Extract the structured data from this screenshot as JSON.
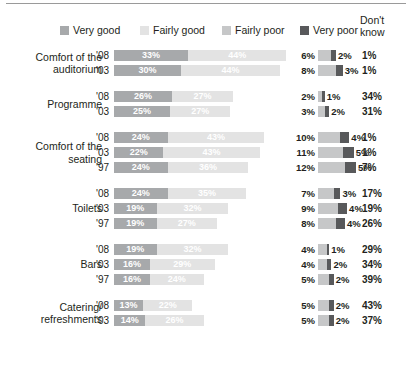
{
  "legend": {
    "items": [
      {
        "label": "Very good",
        "color": "#a7a9ab",
        "icon": "square-swatch-icon"
      },
      {
        "label": "Fairly good",
        "color": "#e3e3e3",
        "icon": "square-swatch-icon"
      },
      {
        "label": "Fairly poor",
        "color": "#c6c7c8",
        "icon": "square-swatch-icon"
      },
      {
        "label": "Very poor",
        "color": "#58595b",
        "icon": "square-swatch-icon"
      }
    ],
    "dont_know_header_line1": "Don't",
    "dont_know_header_line2": "know"
  },
  "chart_data": {
    "type": "bar",
    "orientation": "horizontal",
    "stacked": true,
    "title": "",
    "xlabel": "",
    "ylabel": "",
    "grid": false,
    "legend_position": "top",
    "series": [
      {
        "name": "Very good",
        "color": "#a7a9ab"
      },
      {
        "name": "Fairly good",
        "color": "#e3e3e3"
      },
      {
        "name": "Fairly poor",
        "color": "#c6c7c8"
      },
      {
        "name": "Very poor",
        "color": "#58595b"
      },
      {
        "name": "Don't know",
        "color": "#ffffff"
      }
    ],
    "groups": [
      {
        "label": "Comfort of the auditorium",
        "label_lines": [
          "Comfort of the",
          "auditorium"
        ],
        "rows": [
          {
            "year": "'08",
            "very_good": 33,
            "fairly_good": 44,
            "fairly_poor": 6,
            "very_poor": 2,
            "dont_know": 1,
            "very_good_text": "33%",
            "fairly_good_text": "44%",
            "fairly_poor_text": "6%",
            "very_poor_text": "2%",
            "dont_know_text": "1%"
          },
          {
            "year": "'03",
            "very_good": 30,
            "fairly_good": 44,
            "fairly_poor": 8,
            "very_poor": 3,
            "dont_know": 1,
            "very_good_text": "30%",
            "fairly_good_text": "44%",
            "fairly_poor_text": "8%",
            "very_poor_text": "3%",
            "dont_know_text": "1%"
          }
        ]
      },
      {
        "label": "Programme",
        "label_lines": [
          "Programme"
        ],
        "rows": [
          {
            "year": "'08",
            "very_good": 26,
            "fairly_good": 27,
            "fairly_poor": 2,
            "very_poor": 1,
            "dont_know": 34,
            "very_good_text": "26%",
            "fairly_good_text": "27%",
            "fairly_poor_text": "2%",
            "very_poor_text": "1%",
            "dont_know_text": "34%"
          },
          {
            "year": "'03",
            "very_good": 25,
            "fairly_good": 27,
            "fairly_poor": 3,
            "very_poor": 2,
            "dont_know": 31,
            "very_good_text": "25%",
            "fairly_good_text": "27%",
            "fairly_poor_text": "3%",
            "very_poor_text": "2%",
            "dont_know_text": "31%"
          }
        ]
      },
      {
        "label": "Comfort of the seating",
        "label_lines": [
          "Comfort of the",
          "seating"
        ],
        "rows": [
          {
            "year": "'08",
            "very_good": 24,
            "fairly_good": 43,
            "fairly_poor": 10,
            "very_poor": 4,
            "dont_know": 1,
            "very_good_text": "24%",
            "fairly_good_text": "43%",
            "fairly_poor_text": "10%",
            "very_poor_text": "4%",
            "dont_know_text": "1%"
          },
          {
            "year": "'03",
            "very_good": 22,
            "fairly_good": 43,
            "fairly_poor": 11,
            "very_poor": 5,
            "dont_know": 1,
            "very_good_text": "22%",
            "fairly_good_text": "43%",
            "fairly_poor_text": "11%",
            "very_poor_text": "5%",
            "dont_know_text": "1%"
          },
          {
            "year": "'97",
            "very_good": 24,
            "fairly_good": 36,
            "fairly_poor": 12,
            "very_poor": 5,
            "dont_know": 7,
            "very_good_text": "24%",
            "fairly_good_text": "36%",
            "fairly_poor_text": "12%",
            "very_poor_text": "5%",
            "dont_know_text": "7%"
          }
        ]
      },
      {
        "label": "Toilets",
        "label_lines": [
          "Toilets"
        ],
        "rows": [
          {
            "year": "'08",
            "very_good": 24,
            "fairly_good": 35,
            "fairly_poor": 7,
            "very_poor": 3,
            "dont_know": 17,
            "very_good_text": "24%",
            "fairly_good_text": "35%",
            "fairly_poor_text": "7%",
            "very_poor_text": "3%",
            "dont_know_text": "17%"
          },
          {
            "year": "'03",
            "very_good": 19,
            "fairly_good": 32,
            "fairly_poor": 9,
            "very_poor": 4,
            "dont_know": 19,
            "very_good_text": "19%",
            "fairly_good_text": "32%",
            "fairly_poor_text": "9%",
            "very_poor_text": "4%",
            "dont_know_text": "19%"
          },
          {
            "year": "'97",
            "very_good": 19,
            "fairly_good": 27,
            "fairly_poor": 8,
            "very_poor": 4,
            "dont_know": 26,
            "very_good_text": "19%",
            "fairly_good_text": "27%",
            "fairly_poor_text": "8%",
            "very_poor_text": "4%",
            "dont_know_text": "26%"
          }
        ]
      },
      {
        "label": "Bars",
        "label_lines": [
          "Bars"
        ],
        "rows": [
          {
            "year": "'08",
            "very_good": 19,
            "fairly_good": 32,
            "fairly_poor": 4,
            "very_poor": 1,
            "dont_know": 29,
            "very_good_text": "19%",
            "fairly_good_text": "32%",
            "fairly_poor_text": "4%",
            "very_poor_text": "1%",
            "dont_know_text": "29%"
          },
          {
            "year": "'03",
            "very_good": 16,
            "fairly_good": 29,
            "fairly_poor": 4,
            "very_poor": 2,
            "dont_know": 34,
            "very_good_text": "16%",
            "fairly_good_text": "29%",
            "fairly_poor_text": "4%",
            "very_poor_text": "2%",
            "dont_know_text": "34%"
          },
          {
            "year": "'97",
            "very_good": 16,
            "fairly_good": 24,
            "fairly_poor": 5,
            "very_poor": 2,
            "dont_know": 39,
            "very_good_text": "16%",
            "fairly_good_text": "24%",
            "fairly_poor_text": "5%",
            "very_poor_text": "2%",
            "dont_know_text": "39%"
          }
        ]
      },
      {
        "label": "Catering/ refreshments",
        "label_lines": [
          "Catering/",
          "refreshments"
        ],
        "rows": [
          {
            "year": "'08",
            "very_good": 13,
            "fairly_good": 22,
            "fairly_poor": 5,
            "very_poor": 2,
            "dont_know": 43,
            "very_good_text": "13%",
            "fairly_good_text": "22%",
            "fairly_poor_text": "5%",
            "very_poor_text": "2%",
            "dont_know_text": "43%"
          },
          {
            "year": "'03",
            "very_good": 14,
            "fairly_good": 26,
            "fairly_poor": 5,
            "very_poor": 2,
            "dont_know": 37,
            "very_good_text": "14%",
            "fairly_good_text": "26%",
            "fairly_poor_text": "5%",
            "very_poor_text": "2%",
            "dont_know_text": "37%"
          }
        ]
      }
    ]
  }
}
